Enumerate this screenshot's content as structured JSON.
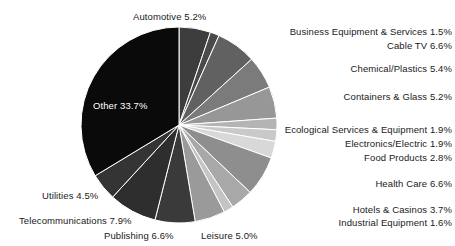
{
  "chart_data": {
    "type": "pie",
    "title": "",
    "subtitle": "",
    "xlabel": "",
    "ylabel": "",
    "legend_position": "callout-labels",
    "grid": false,
    "start_angle_deg": 0,
    "direction": "clockwise",
    "units": "percent",
    "categories": [
      "Automotive",
      "Business Equipment & Services",
      "Cable TV",
      "Chemical/Plastics",
      "Containers & Glass",
      "Ecological Services & Equipment",
      "Electronics/Electric",
      "Food Products",
      "Health Care",
      "Hotels & Casinos",
      "Industrial Equipment",
      "Leisure",
      "Publishing",
      "Telecommunications",
      "Utilities",
      "Other"
    ],
    "values": [
      5.2,
      1.5,
      6.6,
      5.4,
      5.2,
      1.9,
      1.9,
      2.8,
      6.6,
      3.7,
      1.6,
      5.0,
      6.6,
      7.9,
      4.5,
      33.7
    ],
    "colors": [
      "#3d3d3d",
      "#4a4a4a",
      "#616161",
      "#7b7b7b",
      "#979797",
      "#b4b4b4",
      "#c9c9c9",
      "#d8d8d8",
      "#8e8e8e",
      "#a8a8a8",
      "#c4c4c4",
      "#9a9a9a",
      "#3a3a3a",
      "#2e2e2e",
      "#343434",
      "#0a0a0a"
    ],
    "slice_labels": [
      "Automotive 5.2%",
      "Business Equipment & Services 1.5%",
      "Cable TV 6.6%",
      "Chemical/Plastics 5.4%",
      "Containers & Glass 5.2%",
      "Ecological Services & Equipment 1.9%",
      "Electronics/Electric 1.9%",
      "Food Products 2.8%",
      "Health Care 6.6%",
      "Hotels & Casinos 3.7%",
      "Industrial Equipment 1.6%",
      "Leisure 5.0%",
      "Publishing 6.6%",
      "Telecommunications 7.9%",
      "Utilities 4.5%",
      "Other 33.7%"
    ]
  },
  "geometry": {
    "center_x": 179,
    "center_y": 125,
    "radius": 98,
    "separator_color": "#ffffff",
    "background": "#ffffff"
  },
  "labels": {
    "automotive": "Automotive 5.2%",
    "business_equipment": "Business Equipment & Services 1.5%",
    "cable_tv": "Cable TV 6.6%",
    "chemical_plastics": "Chemical/Plastics 5.4%",
    "containers_glass": "Containers & Glass 5.2%",
    "ecological": "Ecological Services & Equipment 1.9%",
    "electronics": "Electronics/Electric 1.9%",
    "food_products": "Food Products 2.8%",
    "health_care": "Health Care 6.6%",
    "hotels_casinos": "Hotels & Casinos 3.7%",
    "industrial_equipment": "Industrial Equipment 1.6%",
    "leisure": "Leisure 5.0%",
    "publishing": "Publishing 6.6%",
    "telecommunications": "Telecommunications 7.9%",
    "utilities": "Utilities 4.5%",
    "other": "Other 33.7%"
  }
}
